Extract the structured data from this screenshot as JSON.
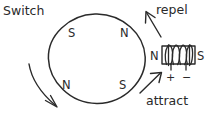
{
  "diagram": {
    "title_label": "Switch",
    "rotor": {
      "poles": [
        {
          "id": "top-left",
          "label": "S"
        },
        {
          "id": "top-right",
          "label": "N"
        },
        {
          "id": "bottom-left",
          "label": "N"
        },
        {
          "id": "bottom-right",
          "label": "S"
        }
      ]
    },
    "solenoid": {
      "left_pole_label": "N",
      "right_pole_label": "S",
      "positive_terminal": "+",
      "negative_terminal": "−",
      "winding_count": 4
    },
    "forces": [
      {
        "id": "repel",
        "label": "repel",
        "direction": "up-left"
      },
      {
        "id": "attract",
        "label": "attract",
        "direction": "up-right"
      }
    ],
    "rotation": {
      "id": "rotation-arrow",
      "direction": "clockwise-down-right"
    },
    "colors": {
      "ink": "#2a2a2a",
      "background": "#ffffff"
    }
  }
}
